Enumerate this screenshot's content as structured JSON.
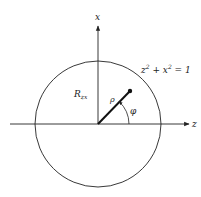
{
  "diagram": {
    "axes": {
      "horizontal_label": "z",
      "vertical_label": "x"
    },
    "circle": {
      "equation": {
        "var1": "z",
        "exp1": "2",
        "plus": " + ",
        "var2": "x",
        "exp2": "2",
        "rhs": " = 1"
      }
    },
    "labels": {
      "radius": "R",
      "radius_subscript": "zx",
      "rho": "ρ",
      "phi": "φ"
    },
    "colors": {
      "stroke": "#222222",
      "background": "#ffffff"
    }
  }
}
